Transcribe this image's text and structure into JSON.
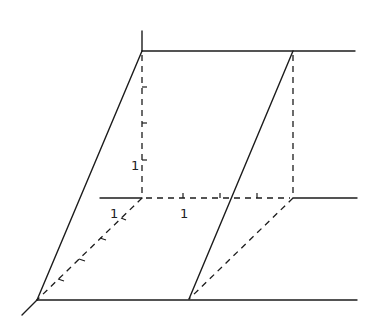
{
  "diagram": {
    "title": "",
    "labels": {
      "vertical_unit": "1",
      "horizontal_unit": "1",
      "depth_unit": "1"
    },
    "colors": {
      "background": "#ffffff",
      "stroke": "#1c1c1c"
    }
  }
}
